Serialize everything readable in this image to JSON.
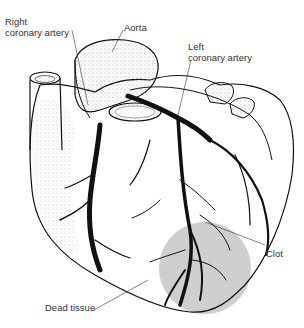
{
  "diagram": {
    "labels": {
      "right_coronary_artery": [
        "Right",
        "coronary artery"
      ],
      "aorta": "Aorta",
      "left_coronary_artery": [
        "Left",
        "coronary artery"
      ],
      "clot": "Clot",
      "dead_tissue": "Dead tissue"
    },
    "colors": {
      "ink": "#111111",
      "dead_tissue_fill": "#cfcfcf",
      "background": "#ffffff",
      "label_text": "#333333"
    }
  }
}
